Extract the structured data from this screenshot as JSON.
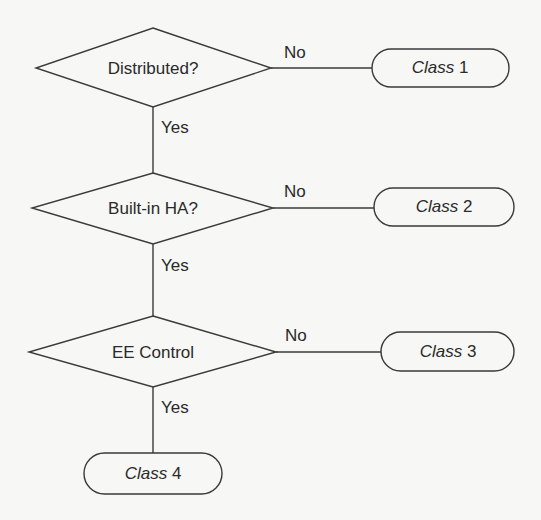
{
  "diagram": {
    "type": "flowchart",
    "decisions": [
      {
        "id": "d1",
        "label": "Distributed?"
      },
      {
        "id": "d2",
        "label": "Built-in HA?"
      },
      {
        "id": "d3",
        "label": "EE Control"
      }
    ],
    "terminals": [
      {
        "id": "c1",
        "word": "Class",
        "number": "1"
      },
      {
        "id": "c2",
        "word": "Class",
        "number": "2"
      },
      {
        "id": "c3",
        "word": "Class",
        "number": "3"
      },
      {
        "id": "c4",
        "word": "Class",
        "number": "4"
      }
    ],
    "edges": [
      {
        "from": "d1",
        "to": "c1",
        "label": "No"
      },
      {
        "from": "d1",
        "to": "d2",
        "label": "Yes"
      },
      {
        "from": "d2",
        "to": "c2",
        "label": "No"
      },
      {
        "from": "d2",
        "to": "d3",
        "label": "Yes"
      },
      {
        "from": "d3",
        "to": "c3",
        "label": "No"
      },
      {
        "from": "d3",
        "to": "c4",
        "label": "Yes"
      }
    ]
  }
}
